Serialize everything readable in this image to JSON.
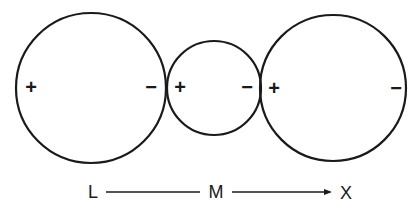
{
  "diagram": {
    "stroke_color": "#1a1a1a",
    "circles": [
      {
        "name": "left-circle",
        "cx": 91,
        "cy": 88,
        "r": 75,
        "left_sign": "+",
        "right_sign": "−"
      },
      {
        "name": "middle-circle",
        "cx": 214,
        "cy": 88,
        "r": 47,
        "left_sign": "+",
        "right_sign": "−"
      },
      {
        "name": "right-circle",
        "cx": 333,
        "cy": 88,
        "r": 73,
        "left_sign": "+",
        "right_sign": "−"
      }
    ],
    "axis": {
      "labels": [
        "L",
        "M",
        "X"
      ],
      "arrow": "arrow-right-icon"
    }
  }
}
